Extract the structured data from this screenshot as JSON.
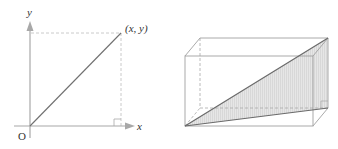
{
  "left_figure": {
    "axis_y_label": "y",
    "axis_x_label": "x",
    "origin_label": "O",
    "point_label": "(x, y)",
    "colors": {
      "axis": "#a8a8a8",
      "line": "#707070",
      "dashed": "#b8b8b8"
    }
  },
  "right_figure": {
    "description": "Rectangular box (cuboid) with shaded diagonal triangular cross-section",
    "colors": {
      "edge": "#a0a0a0",
      "hidden_edge": "#a8a8a8",
      "diagonal": "#6a6a6a",
      "shade": "#dcdcdc"
    }
  }
}
